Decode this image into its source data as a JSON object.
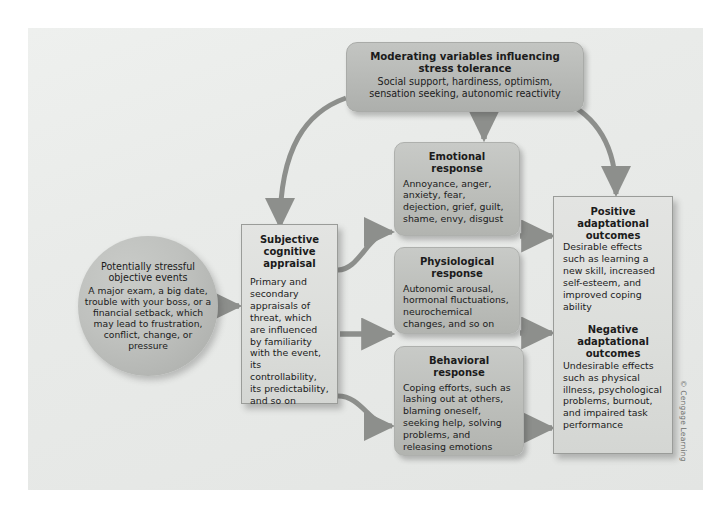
{
  "figure": {
    "copyright": "© Cengage Learning",
    "colors": {
      "canvas_bg": "#e9ebe9",
      "round_box": "#b7b9b6",
      "response_box": "#bcbeba",
      "square_box": "#dcdedb",
      "circle": "#bfc1be",
      "arrow": "#8d8f8c",
      "text": "#1b1b1b"
    }
  },
  "nodes": {
    "moderating": {
      "title": "Moderating variables influencing stress tolerance",
      "body": "Social support, hardiness, optimism, sensation seeking, autonomic reactivity"
    },
    "stressful_events": {
      "title": "Potentially stressful objective events",
      "body": "A major exam, a big date, trouble with your boss, or a financial setback, which may lead to frustration, conflict, change, or pressure"
    },
    "appraisal": {
      "title": "Subjective cognitive appraisal",
      "body": "Primary and secondary appraisals of threat, which are influenced by familiarity with the event, its controllability, its predictability, and so on"
    },
    "emotional": {
      "title": "Emotional response",
      "body": "Annoyance, anger, anxiety, fear, dejection, grief, guilt, shame, envy, disgust"
    },
    "physiological": {
      "title": "Physiological response",
      "body": "Autonomic arousal, hormonal fluctuations, neurochemical changes, and so on"
    },
    "behavioral": {
      "title": "Behavioral response",
      "body": "Coping efforts, such as lashing out at others, blaming oneself, seeking help, solving problems, and releasing emotions"
    },
    "positive_outcomes": {
      "title": "Positive adaptational outcomes",
      "body": "Desirable effects such as learning a new skill, increased self-esteem, and improved coping ability"
    },
    "negative_outcomes": {
      "title": "Negative adaptational outcomes",
      "body": "Undesirable effects such as physical illness, psychological problems, burnout, and impaired task performance"
    }
  }
}
